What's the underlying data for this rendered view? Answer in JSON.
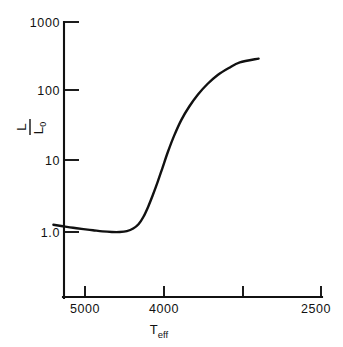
{
  "figure": {
    "background_color": "#ffffff",
    "line_color": "#111111"
  },
  "chart_data": {
    "type": "line",
    "title": "",
    "subtitle": "",
    "xlabel": "T_eff",
    "xlabel_base": "T",
    "xlabel_sub": "eff",
    "ylabel": "L/L_0",
    "ylabel_numerator": "L",
    "ylabel_denominator": "L",
    "ylabel_denominator_sub": "0",
    "xscale": "linear-reversed",
    "yscale": "log",
    "xlim": [
      5400,
      2500
    ],
    "ylim": [
      1.0,
      1000
    ],
    "grid": false,
    "legend": null,
    "annotations": [],
    "xticks": [
      5000,
      4000,
      3000,
      2500
    ],
    "xticklabels": [
      "5000",
      "4000",
      "",
      "2500"
    ],
    "yticks": [
      1.0,
      10,
      100,
      1000
    ],
    "yticklabels": [
      "1.0",
      "10",
      "100",
      "1000"
    ],
    "series": [
      {
        "name": "evolutionary track",
        "x": [
          5400,
          5280,
          5150,
          5020,
          4900,
          4780,
          4660,
          4560,
          4470,
          4390,
          4320,
          4260,
          4200,
          4140,
          4080,
          4020,
          3950,
          3870,
          3780,
          3680,
          3570,
          3450,
          3320,
          3180,
          3040,
          2900
        ],
        "y": [
          1.27,
          1.21,
          1.15,
          1.1,
          1.06,
          1.02,
          1.0,
          1.0,
          1.03,
          1.12,
          1.3,
          1.65,
          2.3,
          3.4,
          5.2,
          8.2,
          14,
          24,
          40,
          62,
          92,
          130,
          175,
          220,
          265,
          300
        ]
      }
    ]
  }
}
